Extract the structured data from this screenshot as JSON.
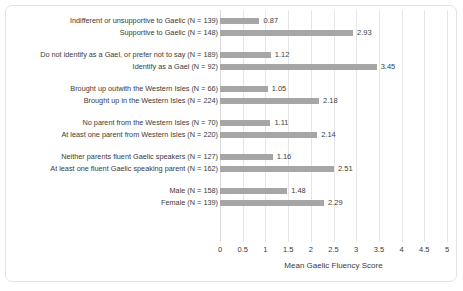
{
  "chart_data": {
    "type": "bar",
    "orientation": "horizontal",
    "title": "",
    "xlabel": "Mean Gaelic Fluency Score",
    "ylabel": "",
    "xlim": [
      0,
      5
    ],
    "xticks": [
      "0",
      "0.5",
      "1",
      "1.5",
      "2",
      "2.5",
      "3",
      "3.5",
      "4",
      "4.5",
      "5"
    ],
    "xtick_values": [
      0,
      0.5,
      1,
      1.5,
      2,
      2.5,
      3,
      3.5,
      4,
      4.5,
      5
    ],
    "grid": "vertical",
    "legend": "none",
    "bar_color": "#a6a6a6",
    "groups": [
      {
        "name": "attitude-to-gaelic",
        "bars": [
          {
            "category": "Indifferent or unsupportive to Gaelic (N = 139)",
            "value": 0.87,
            "label": "0.87"
          },
          {
            "category": "Supportive to Gaelic (N  = 148)",
            "value": 2.93,
            "label": "2.93"
          }
        ]
      },
      {
        "name": "gael-identity",
        "bars": [
          {
            "category": "Do not identify as a Gael, or prefer not to say (N = 189)",
            "value": 1.12,
            "label": "1.12"
          },
          {
            "category": "Identify as a Gael (N = 92)",
            "value": 3.45,
            "label": "3.45"
          }
        ]
      },
      {
        "name": "brought-up-location",
        "bars": [
          {
            "category": "Brought up outwith the Western Isles (N = 66)",
            "value": 1.05,
            "label": "1.05"
          },
          {
            "category": "Brought up in the Western Isles (N = 224)",
            "value": 2.18,
            "label": "2.18"
          }
        ]
      },
      {
        "name": "parent-origin",
        "bars": [
          {
            "category": "No parent from the Western Isles (N = 70)",
            "value": 1.11,
            "label": "1.11"
          },
          {
            "category": "At least one parent from Western Isles  (N = 220)",
            "value": 2.14,
            "label": "2.14"
          }
        ]
      },
      {
        "name": "parent-fluency",
        "bars": [
          {
            "category": "Neither parents fluent Gaelic speakers (N = 127)",
            "value": 1.16,
            "label": "1.16"
          },
          {
            "category": "At least one fluent Gaelic speaking parent (N = 162)",
            "value": 2.51,
            "label": "2.51"
          }
        ]
      },
      {
        "name": "gender",
        "bars": [
          {
            "category": "Male (N = 158)",
            "value": 1.48,
            "label": "1.48"
          },
          {
            "category": "Female (N = 139)",
            "value": 2.29,
            "label": "2.29"
          }
        ]
      }
    ]
  }
}
